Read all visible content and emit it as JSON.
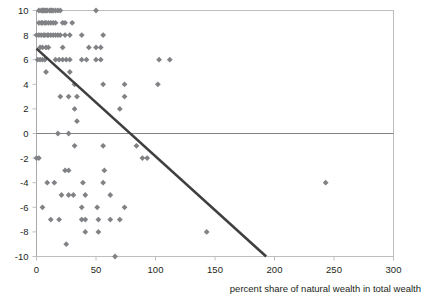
{
  "chart_data": {
    "type": "scatter",
    "title": "",
    "xlabel": "percent share of natural wealth in total wealth",
    "ylabel": "",
    "xlim": [
      0,
      300
    ],
    "ylim": [
      -10,
      10
    ],
    "xticks": [
      0,
      50,
      100,
      150,
      200,
      250,
      300
    ],
    "yticks": [
      -10,
      -8,
      -6,
      -4,
      -2,
      0,
      2,
      4,
      6,
      8,
      10
    ],
    "grid": false,
    "legend": "none",
    "marker": "diamond",
    "marker_color": "#808285",
    "zero_line": true,
    "trendline": {
      "label": "linear trend",
      "color": "#3f3f3f",
      "x0": 0,
      "y0": 6.9,
      "x1": 193,
      "y1": -10
    },
    "points": [
      [
        2,
        10
      ],
      [
        4,
        10
      ],
      [
        5,
        10
      ],
      [
        6,
        10
      ],
      [
        7,
        10
      ],
      [
        8,
        10
      ],
      [
        9,
        10
      ],
      [
        11,
        10
      ],
      [
        12,
        10
      ],
      [
        13,
        10
      ],
      [
        14,
        10
      ],
      [
        16,
        10
      ],
      [
        18,
        10
      ],
      [
        20,
        10
      ],
      [
        50,
        10
      ],
      [
        2,
        9
      ],
      [
        4,
        9
      ],
      [
        5,
        9
      ],
      [
        7,
        9
      ],
      [
        8,
        9
      ],
      [
        10,
        9
      ],
      [
        12,
        9
      ],
      [
        14,
        9
      ],
      [
        16,
        9
      ],
      [
        22,
        9
      ],
      [
        24,
        9
      ],
      [
        30,
        9
      ],
      [
        0,
        8
      ],
      [
        2,
        8
      ],
      [
        4,
        8
      ],
      [
        6,
        8
      ],
      [
        7,
        8
      ],
      [
        9,
        8
      ],
      [
        10,
        8
      ],
      [
        12,
        8
      ],
      [
        14,
        8
      ],
      [
        16,
        8
      ],
      [
        18,
        8
      ],
      [
        20,
        8
      ],
      [
        24,
        8
      ],
      [
        28,
        8
      ],
      [
        38,
        8
      ],
      [
        56,
        8
      ],
      [
        3,
        7
      ],
      [
        5,
        7
      ],
      [
        8,
        7
      ],
      [
        10,
        7
      ],
      [
        22,
        7
      ],
      [
        44,
        7
      ],
      [
        50,
        7
      ],
      [
        54,
        7
      ],
      [
        1,
        6
      ],
      [
        3,
        6
      ],
      [
        5,
        6
      ],
      [
        7,
        6
      ],
      [
        16,
        6
      ],
      [
        19,
        6
      ],
      [
        22,
        6
      ],
      [
        25,
        6
      ],
      [
        28,
        6
      ],
      [
        38,
        6
      ],
      [
        42,
        6
      ],
      [
        50,
        6
      ],
      [
        54,
        6
      ],
      [
        103,
        6
      ],
      [
        112,
        6
      ],
      [
        8,
        5
      ],
      [
        28,
        5
      ],
      [
        32,
        4
      ],
      [
        56,
        4
      ],
      [
        74,
        4
      ],
      [
        102,
        4
      ],
      [
        20,
        3
      ],
      [
        27,
        3
      ],
      [
        34,
        3
      ],
      [
        74,
        3
      ],
      [
        32,
        2
      ],
      [
        70,
        2
      ],
      [
        34,
        1
      ],
      [
        18,
        0
      ],
      [
        27,
        0
      ],
      [
        32,
        -1
      ],
      [
        56,
        -1
      ],
      [
        84,
        -1
      ],
      [
        0,
        -2
      ],
      [
        2,
        -2
      ],
      [
        89,
        -2
      ],
      [
        93,
        -2
      ],
      [
        24,
        -3
      ],
      [
        27,
        -3
      ],
      [
        57,
        -3
      ],
      [
        9,
        -4
      ],
      [
        15,
        -4
      ],
      [
        39,
        -4
      ],
      [
        56,
        -4
      ],
      [
        243,
        -4
      ],
      [
        21,
        -5
      ],
      [
        27,
        -5
      ],
      [
        31,
        -5
      ],
      [
        41,
        -5
      ],
      [
        62,
        -5
      ],
      [
        5,
        -6
      ],
      [
        38,
        -6
      ],
      [
        51,
        -6
      ],
      [
        74,
        -6
      ],
      [
        12,
        -7
      ],
      [
        19,
        -7
      ],
      [
        38,
        -7
      ],
      [
        41,
        -7
      ],
      [
        52,
        -7
      ],
      [
        62,
        -7
      ],
      [
        70,
        -7
      ],
      [
        41,
        -8
      ],
      [
        52,
        -8
      ],
      [
        143,
        -8
      ],
      [
        25,
        -9
      ],
      [
        66,
        -10
      ]
    ]
  }
}
